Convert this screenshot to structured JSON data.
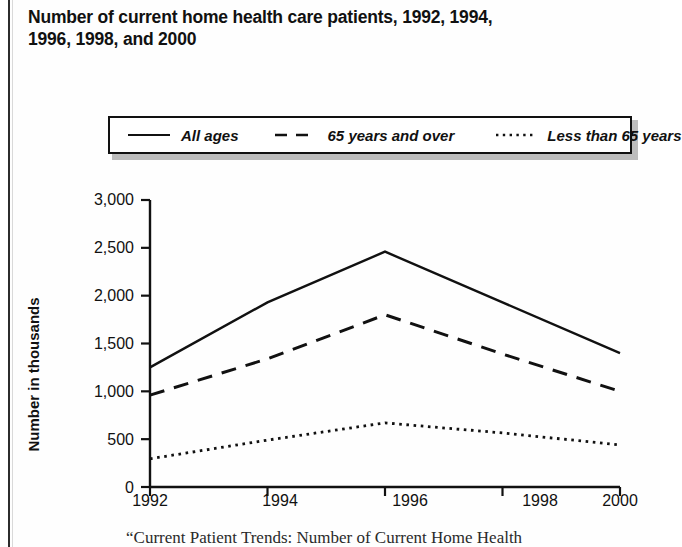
{
  "title": {
    "line1": "Number of current home health care patients, 1992, 1994,",
    "line2": "1996, 1998, and 2000"
  },
  "caption": {
    "text": "“Current Patient Trends: Number of Current Home Health"
  },
  "legend": {
    "items": [
      {
        "label": "All ages",
        "style": "solid",
        "sample": "solid-line-sample"
      },
      {
        "label": "65 years and over",
        "style": "dashed",
        "sample": "dashed-line-sample"
      },
      {
        "label": "Less than 65 years",
        "style": "dotted",
        "sample": "dotted-line-sample"
      }
    ]
  },
  "chart_data": {
    "type": "line",
    "title": "Number of current home health care patients, 1992, 1994, 1996, 1998, and 2000",
    "xlabel": "",
    "ylabel": "Number in thousands",
    "x": [
      1992,
      1994,
      1996,
      1998,
      2000
    ],
    "xtick_labels": [
      "1992",
      "1994",
      "1996",
      "1998",
      "2000"
    ],
    "ytick_labels": [
      "3,000",
      "2,500",
      "2,000",
      "1,500",
      "1,000",
      "500",
      "0"
    ],
    "yticks": [
      3000,
      2500,
      2000,
      1500,
      1000,
      500,
      0
    ],
    "ylim": [
      0,
      3000
    ],
    "xlim": [
      1992,
      2000
    ],
    "grid": false,
    "legend_position": "top",
    "series": [
      {
        "name": "All ages",
        "style": "solid",
        "values": [
          1250,
          1930,
          2460,
          1930,
          1400
        ]
      },
      {
        "name": "65 years and over",
        "style": "dashed",
        "values": [
          960,
          1340,
          1800,
          1390,
          1000
        ]
      },
      {
        "name": "Less than 65 years",
        "style": "dotted",
        "values": [
          295,
          490,
          670,
          565,
          440
        ]
      }
    ]
  },
  "colors": {
    "ink": "#111111",
    "page": "#ffffff",
    "shadow": "#bdbdbd"
  }
}
